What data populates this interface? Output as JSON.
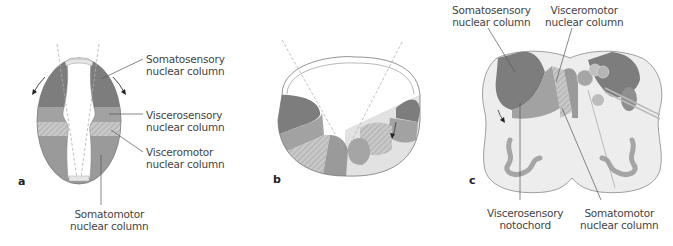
{
  "colors": {
    "dark": "#7a7a7a",
    "mid_dark": "#8f8f8f",
    "mid": "#a5a5a5",
    "light": "#c4c4c4",
    "pale": "#e4e4e4",
    "line": "#555555",
    "dashed": "#b0b0b0"
  },
  "panel_a": {
    "letter": "a",
    "labels": {
      "somatosensory": [
        "Somatosensory",
        "nuclear column"
      ],
      "viscerosensory": [
        "Viscerosensory",
        "nuclear column"
      ],
      "visceromotor": [
        "Visceromotor",
        "nuclear column"
      ],
      "somatomotor": [
        "Somatomotor",
        "nuclear column"
      ]
    }
  },
  "panel_b": {
    "letter": "b"
  },
  "panel_c": {
    "letter": "c",
    "labels": {
      "somatosensory": [
        "Somatosensory",
        "nuclear column"
      ],
      "visceromotor": [
        "Visceromotor",
        "nuclear column"
      ],
      "viscerosensory": [
        "Viscerosensory",
        "notochord"
      ],
      "somatomotor": [
        "Somatomotor",
        "nuclear column"
      ]
    }
  }
}
